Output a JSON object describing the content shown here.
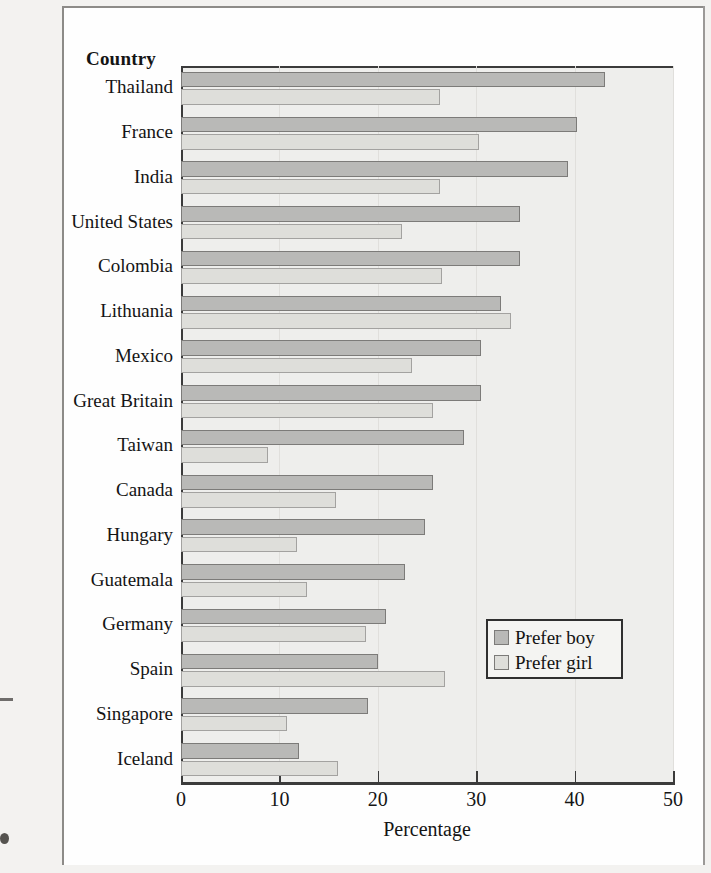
{
  "chart_data": {
    "type": "bar",
    "orientation": "horizontal",
    "title": "",
    "xlabel": "Percentage",
    "ylabel": "Country",
    "xlim": [
      0,
      50
    ],
    "xticks": [
      0,
      10,
      20,
      30,
      40,
      50
    ],
    "grid": true,
    "legend_position": "lower-right",
    "categories": [
      "Thailand",
      "France",
      "India",
      "United States",
      "Colombia",
      "Lithuania",
      "Mexico",
      "Great Britain",
      "Taiwan",
      "Canada",
      "Hungary",
      "Guatemala",
      "Germany",
      "Spain",
      "Singapore",
      "Iceland"
    ],
    "series": [
      {
        "name": "Prefer boy",
        "color": "#b9b9b7",
        "values": [
          43.1,
          40.2,
          39.3,
          34.5,
          34.5,
          32.5,
          30.5,
          30.5,
          28.8,
          25.6,
          24.8,
          22.8,
          20.8,
          20.0,
          19.0,
          12.0
        ]
      },
      {
        "name": "Prefer girl",
        "color": "#dededa",
        "values": [
          26.3,
          30.3,
          26.3,
          22.5,
          26.5,
          33.5,
          23.5,
          25.6,
          8.8,
          15.8,
          11.8,
          12.8,
          18.8,
          26.8,
          10.8,
          16.0
        ]
      }
    ]
  },
  "legend": {
    "entries": [
      {
        "label": "Prefer boy",
        "swatch": "#b9b9b7"
      },
      {
        "label": "Prefer girl",
        "swatch": "#dededa"
      }
    ]
  }
}
